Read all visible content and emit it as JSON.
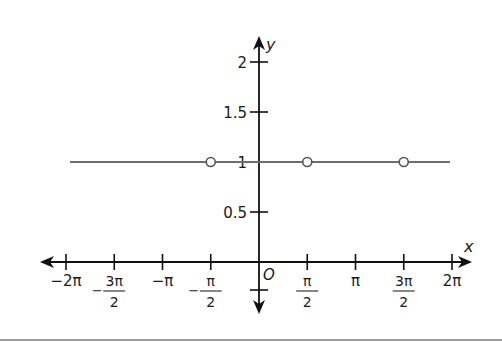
{
  "chart_data": {
    "type": "line",
    "title": "",
    "xlabel": "x",
    "ylabel": "y",
    "origin_label": "O",
    "xlim": [
      -6.2832,
      6.2832
    ],
    "ylim": [
      -0.5,
      2
    ],
    "grid": false,
    "legend": null,
    "x_ticks": [
      {
        "value": -6.2832,
        "label": "−2π"
      },
      {
        "value": -4.7124,
        "label_num": "3π",
        "label_den": "2",
        "sign": "−"
      },
      {
        "value": -3.1416,
        "label": "−π"
      },
      {
        "value": -1.5708,
        "label_num": "π",
        "label_den": "2",
        "sign": "−"
      },
      {
        "value": 1.5708,
        "label_num": "π",
        "label_den": "2",
        "sign": ""
      },
      {
        "value": 3.1416,
        "label": "π"
      },
      {
        "value": 4.7124,
        "label_num": "3π",
        "label_den": "2",
        "sign": ""
      },
      {
        "value": 6.2832,
        "label": "2π"
      }
    ],
    "y_ticks": [
      {
        "value": 2,
        "label": "2"
      },
      {
        "value": 1.5,
        "label": "1.5"
      },
      {
        "value": 1,
        "label": "1"
      },
      {
        "value": 0.5,
        "label": "0.5"
      },
      {
        "value": -0.28,
        "label": ""
      }
    ],
    "series": [
      {
        "name": "y = 1",
        "x": [
          -7.3,
          7.0
        ],
        "y": [
          1,
          1
        ],
        "color": "#6d6d6d",
        "open_points": [
          {
            "x": -1.5708,
            "y": 1
          },
          {
            "x": 1.5708,
            "y": 1
          },
          {
            "x": 4.7124,
            "y": 1
          }
        ]
      }
    ]
  },
  "labels": {
    "x_axis": "x",
    "y_axis": "y",
    "origin": "O"
  }
}
